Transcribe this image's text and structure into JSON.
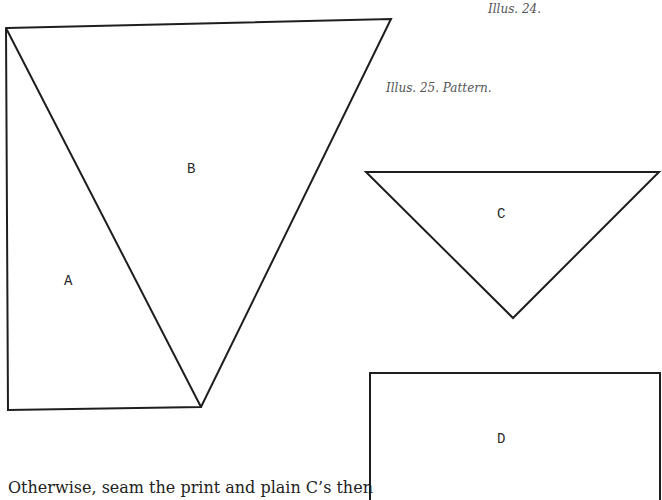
{
  "captions": {
    "illus_24": "Illus. 24.",
    "illus_25": "Illus. 25. Pattern."
  },
  "pieces": {
    "A": {
      "label": "A"
    },
    "B": {
      "label": "B"
    },
    "C": {
      "label": "C"
    },
    "D": {
      "label": "D"
    }
  },
  "body_text": {
    "line_1": "Otherwise, seam the print and plain C’s then"
  },
  "colors": {
    "line": "#1e1e1e",
    "caption": "#555555",
    "text": "#222222",
    "background": "#ffffff"
  }
}
